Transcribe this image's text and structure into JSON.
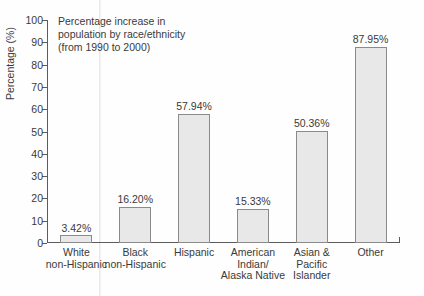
{
  "chart_data": {
    "type": "bar",
    "title": "Percentage increase in population by race/ethnicity (from 1990 to 2000)",
    "note_lines": [
      "Percentage increase in",
      "population by race/ethnicity",
      "(from 1990 to 2000)"
    ],
    "xlabel": "",
    "ylabel": "Percentage (%)",
    "ylim": [
      0,
      100
    ],
    "ytick_values": [
      0,
      10,
      20,
      30,
      40,
      50,
      60,
      70,
      80,
      90,
      100
    ],
    "ytick_labels": [
      "0",
      "10",
      "20",
      "30",
      "40",
      "50",
      "60",
      "70",
      "80",
      "90",
      "100"
    ],
    "grid": false,
    "legend": "none",
    "categories": [
      "White non-Hispanic",
      "Black non-Hispanic",
      "Hispanic",
      "American Indian/ Alaska Native",
      "Asian & Pacific Islander",
      "Other"
    ],
    "category_label_lines": [
      [
        "White",
        "non-Hispanic"
      ],
      [
        "Black",
        "non-Hispanic"
      ],
      [
        "Hispanic"
      ],
      [
        "American",
        "Indian/",
        "Alaska Native"
      ],
      [
        "Asian &",
        "Pacific",
        "Islander"
      ],
      [
        "Other"
      ]
    ],
    "values": [
      3.42,
      16.2,
      57.94,
      15.33,
      50.36,
      87.95
    ],
    "data_labels": [
      "3.42%",
      "16.20%",
      "57.94%",
      "15.33%",
      "50.36%",
      "87.95%"
    ],
    "colors": {
      "bar_fill": "#e8e8e8",
      "bar_border": "#8a8a8a",
      "axis": "#5c5c5c",
      "text": "#3a3a3a",
      "background": "#fefefe"
    }
  }
}
